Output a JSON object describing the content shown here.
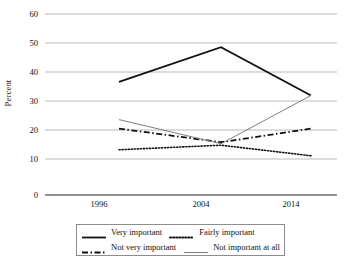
{
  "chart_data": {
    "type": "line",
    "title": "",
    "xlabel": "",
    "ylabel": "Percent",
    "categories": [
      "1996",
      "2004",
      "2014"
    ],
    "x": [
      1996,
      2004,
      2014
    ],
    "ylim": [
      0,
      60
    ],
    "ytick_step": 10,
    "yticks": [
      60,
      50,
      40,
      30,
      20,
      10,
      0
    ],
    "grid": "horizontal",
    "legend_position": "bottom",
    "series": [
      {
        "name": "Very important",
        "values": [
          37.5,
          49,
          33
        ],
        "style": "solid",
        "color": "#111111",
        "width": 1.8
      },
      {
        "name": "Fairly important",
        "values": [
          15,
          16.5,
          13
        ],
        "style": "dotted",
        "color": "#111111",
        "width": 1.6
      },
      {
        "name": "Not very important",
        "values": [
          22,
          17.5,
          22
        ],
        "style": "dashdot",
        "color": "#111111",
        "width": 1.8
      },
      {
        "name": "Not important at all",
        "values": [
          25,
          17,
          33
        ],
        "style": "solid",
        "color": "#7f7f7f",
        "width": 1.0
      }
    ]
  },
  "axis": {
    "y_title": "Percent",
    "y_ticks": [
      "60",
      "50",
      "40",
      "30",
      "20",
      "10",
      "0"
    ],
    "x_ticks": [
      "1996",
      "2004",
      "2014"
    ]
  },
  "legend": {
    "entries": [
      {
        "label": "Very important"
      },
      {
        "label": "Fairly important"
      },
      {
        "label": "Not very important"
      },
      {
        "label": "Not important at all"
      }
    ]
  },
  "colors": {
    "series_dark": "#111111",
    "series_gray": "#7f7f7f",
    "gridline": "#b9b9b9",
    "axis": "#6e6e6e",
    "legend_border": "#8d8d8d",
    "background": "#ffffff"
  }
}
